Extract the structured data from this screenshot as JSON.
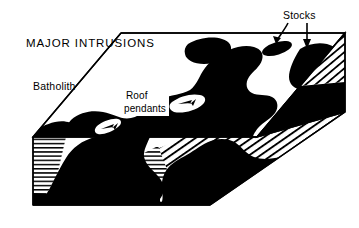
{
  "figure": {
    "title": "MAJOR INTRUSIONS",
    "background_color": "#ffffff",
    "ink_color": "#000000",
    "labels": {
      "batholith": "Batholith",
      "stocks": "Stocks",
      "roof_pendants_line1": "Roof",
      "roof_pendants_line2": "pendants"
    },
    "icons": {
      "stock_arrow_curved": "curved-arrow-icon",
      "stock_arrow_straight": "down-arrow-icon",
      "pendant_arrow_left": "small-arrow-icon",
      "pendant_arrow_right": "small-arrow-icon"
    },
    "geology": {
      "block_type": "three-dimensional block diagram",
      "intrusion_fill": "#000000",
      "country_rock_hatch": "line-hatching",
      "left_face_hatch_direction": "horizontal",
      "front_face_hatch_direction": "diagonal",
      "right_end_hatch_direction": "diagonal"
    }
  }
}
